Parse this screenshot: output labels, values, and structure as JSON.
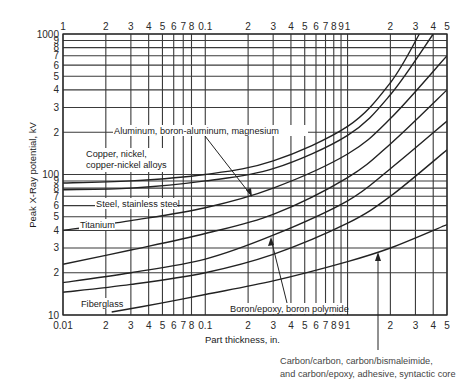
{
  "chart_data": {
    "type": "line",
    "title": "",
    "xlabel": "Part thickness, in.",
    "ylabel": "Peak X-Ray potential, kV",
    "xscale": "log",
    "yscale": "log",
    "xlim": [
      0.01,
      5
    ],
    "ylim": [
      10,
      1000
    ],
    "grid": true,
    "legend": "none (inline labels)",
    "x_tick_labels_bottom": [
      "0.01",
      "2",
      "3",
      "4",
      "5",
      "6",
      "7",
      "8",
      "0.1",
      "2",
      "3",
      "4",
      "5",
      "6",
      "7",
      "8",
      "9",
      "1",
      "2",
      "3",
      "4",
      "5"
    ],
    "x_tick_labels_top": [
      "1",
      "2",
      "3",
      "4",
      "5",
      "6",
      "7",
      "8",
      "0.1",
      "2",
      "3",
      "4",
      "5",
      "6",
      "7",
      "8",
      "9",
      "1",
      "2",
      "3",
      "4",
      "5"
    ],
    "y_tick_labels": [
      "10",
      "2",
      "3",
      "4",
      "5",
      "6",
      "7",
      "8",
      "9",
      "100",
      "2",
      "3",
      "4",
      "5",
      "6",
      "7",
      "8",
      "9",
      "1000"
    ],
    "series": [
      {
        "name": "Copper, nickel, copper-nickel alloys",
        "x": [
          0.01,
          0.03,
          0.1,
          0.3,
          1,
          2,
          3.2
        ],
        "y": [
          87,
          90,
          100,
          125,
          220,
          450,
          1000
        ]
      },
      {
        "name": "Steel, stainless steel",
        "x": [
          0.01,
          0.03,
          0.1,
          0.3,
          1,
          2,
          4.0
        ],
        "y": [
          78,
          80,
          90,
          110,
          190,
          370,
          1000
        ]
      },
      {
        "name": "Titanium",
        "x": [
          0.01,
          0.03,
          0.1,
          0.3,
          1,
          2,
          5
        ],
        "y": [
          40,
          47,
          58,
          80,
          140,
          250,
          700
        ]
      },
      {
        "name": "Aluminum, boron-aluminum, magnesium",
        "x": [
          0.01,
          0.03,
          0.1,
          0.3,
          1,
          2,
          5
        ],
        "y": [
          23,
          29,
          38,
          52,
          95,
          165,
          400
        ]
      },
      {
        "name": "Boron/epoxy (upper)",
        "x": [
          0.01,
          0.03,
          0.1,
          0.3,
          1,
          2,
          5
        ],
        "y": [
          17,
          20,
          25,
          37,
          65,
          110,
          240
        ]
      },
      {
        "name": "Boron polymide (lower)",
        "x": [
          0.01,
          0.03,
          0.1,
          0.3,
          1,
          2,
          5
        ],
        "y": [
          14.5,
          16.5,
          20,
          27,
          45,
          70,
          150
        ]
      },
      {
        "name": "Fiberglass / Carbon-carbon, carbon/bismaleimide, carbon/epoxy, adhesive, syntactic core",
        "x": [
          0.022,
          0.05,
          0.1,
          0.3,
          1,
          2,
          5
        ],
        "y": [
          10.5,
          12.2,
          14,
          17.5,
          24,
          30,
          44
        ]
      }
    ],
    "annotations": [
      {
        "text": "Copper, nickel,",
        "line2": "copper-nickel alloys"
      },
      {
        "text": "Aluminum, boron-aluminum, magnesium"
      },
      {
        "text": "Steel, stainless steel"
      },
      {
        "text": "Titanium"
      },
      {
        "text": "Fiberglass"
      },
      {
        "text": "Boron/epoxy, boron polymide"
      },
      {
        "text": "Carbon/carbon, carbon/bismaleimide,",
        "line2": "and carbon/epoxy, adhesive, syntactic core"
      }
    ]
  },
  "labels": {
    "ylabel": "Peak X-Ray potential, kV",
    "xlabel": "Part thickness, in.",
    "copper_1": "Copper, nickel,",
    "copper_2": "copper-nickel alloys",
    "aluminum": "Aluminum, boron-aluminum, magnesium",
    "steel": "Steel, stainless steel",
    "titanium": "Titanium",
    "fiberglass": "Fiberglass",
    "boron": "Boron/epoxy, boron polymide",
    "carbon_1": "Carbon/carbon, carbon/bismaleimide,",
    "carbon_2": "and carbon/epoxy, adhesive, syntactic core"
  }
}
